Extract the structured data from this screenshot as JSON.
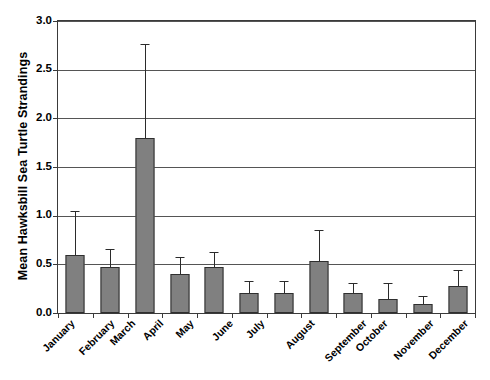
{
  "chart_data": {
    "type": "bar",
    "title": "",
    "xlabel": "",
    "ylabel": "Mean Hawksbill Sea Turtle Strandings",
    "ylim": [
      0.0,
      3.0
    ],
    "ytick_labels": [
      "0.0",
      "0.5",
      "1.0",
      "1.5",
      "2.0",
      "2.5",
      "3.0"
    ],
    "ytick_values": [
      0.0,
      0.5,
      1.0,
      1.5,
      2.0,
      2.5,
      3.0
    ],
    "grid": "horizontal",
    "legend": "none",
    "error_bars": "upper only",
    "categories": [
      "January",
      "February",
      "March",
      "April",
      "May",
      "June",
      "July",
      "August",
      "September",
      "October",
      "November",
      "December"
    ],
    "values": [
      0.6,
      0.47,
      1.8,
      0.4,
      0.47,
      0.21,
      0.21,
      0.53,
      0.21,
      0.14,
      0.09,
      0.28
    ],
    "error_upper": [
      1.04,
      0.65,
      2.75,
      0.57,
      0.62,
      0.32,
      0.32,
      0.84,
      0.3,
      0.3,
      0.16,
      0.43
    ],
    "series": [
      {
        "name": "Mean Hawksbill Sea Turtle Strandings",
        "values": [
          0.6,
          0.47,
          1.8,
          0.4,
          0.47,
          0.21,
          0.21,
          0.53,
          0.21,
          0.14,
          0.09,
          0.28
        ]
      }
    ],
    "colors": {
      "bar_fill": "#808080",
      "bar_edge": "#2f2f2f",
      "gridline": "#555555",
      "axis": "#3a3a3a",
      "background": "#ffffff",
      "text": "#000000"
    }
  }
}
